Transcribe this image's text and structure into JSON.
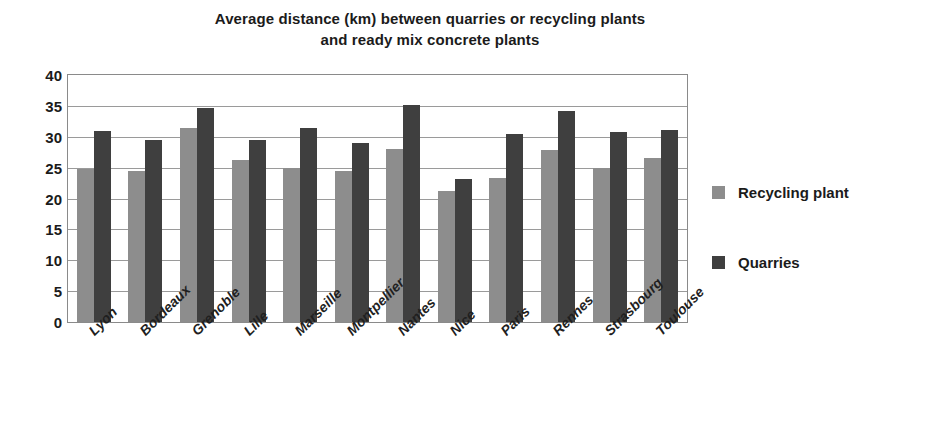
{
  "chart_data": {
    "type": "bar",
    "title": "Average distance (km) between quarries or recycling plants and ready mix concrete plants",
    "title_line1": "Average distance (km) between quarries or recycling plants",
    "title_line2": "and ready mix concrete plants",
    "xlabel": "",
    "ylabel": "",
    "ylim": [
      0,
      40
    ],
    "ytick_step": 5,
    "ytick_labels": [
      "40",
      "35",
      "30",
      "25",
      "20",
      "15",
      "10",
      "5",
      "0"
    ],
    "ytick_values": [
      40,
      35,
      30,
      25,
      20,
      15,
      10,
      5,
      0
    ],
    "grid": true,
    "legend_position": "right",
    "categories": [
      "Lyon",
      "Bordeaux",
      "Grenoble",
      "Lille",
      "Marseille",
      "Montpellier",
      "Nantes",
      "Nice",
      "Paris",
      "Rennes",
      "Strasbourg",
      "Toulouse"
    ],
    "series": [
      {
        "name": "Recycling plant",
        "color": "#8d8d8d",
        "values": [
          24.7,
          24.5,
          31.4,
          26.3,
          25.0,
          24.5,
          28.0,
          21.2,
          23.4,
          27.8,
          25.0,
          26.6
        ]
      },
      {
        "name": "Quarries",
        "color": "#3f3f3f",
        "values": [
          30.9,
          29.4,
          34.6,
          29.5,
          31.4,
          29.0,
          35.1,
          23.1,
          30.4,
          34.1,
          30.8,
          31.1
        ]
      }
    ]
  },
  "legend": {
    "items": [
      {
        "label": "Recycling plant",
        "color": "#8d8d8d"
      },
      {
        "label": "Quarries",
        "color": "#3f3f3f"
      }
    ]
  }
}
